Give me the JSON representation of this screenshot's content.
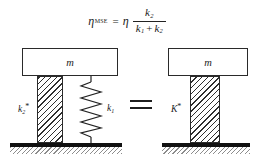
{
  "equation": {
    "lhs_symbol": "η",
    "lhs_subscript": "MSE",
    "equals": "=",
    "rhs_symbol": "η",
    "numerator_symbol": "k",
    "numerator_subscript": "2",
    "denominator_first_symbol": "k",
    "denominator_first_subscript": "1",
    "denominator_operator": "+",
    "denominator_second_symbol": "k",
    "denominator_second_subscript": "2",
    "plain_text": "ηMSE = η k2 / (k1 + k2)"
  },
  "diagram": {
    "equivalence_operator": "=",
    "left_system": {
      "mass_label": "m",
      "damper_column_label": {
        "symbol": "k",
        "subscript": "2",
        "superscript": "*"
      },
      "spring_label": {
        "symbol": "k",
        "subscript": "1",
        "superscript": ""
      },
      "spring_icon": "coil-spring",
      "column_icon": "hatched-viscoelastic-column",
      "ground_icon": "fixed-ground-hatch"
    },
    "right_system": {
      "mass_label": "m",
      "column_label": {
        "symbol": "K",
        "subscript": "",
        "superscript": "*"
      },
      "column_icon": "hatched-viscoelastic-column",
      "ground_icon": "fixed-ground-hatch"
    }
  },
  "colors": {
    "background": "#ffffff",
    "ink": "#1c1c1c",
    "hatch": "#2e2e2e",
    "ground": "#111111",
    "ground_hatch": "#8d8d8d"
  }
}
